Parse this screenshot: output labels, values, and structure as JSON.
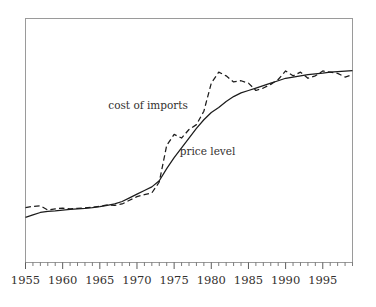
{
  "chart_data": {
    "type": "line",
    "title": "",
    "subtitle": "",
    "xlabel": "",
    "ylabel": "",
    "xlim": [
      1955,
      1999
    ],
    "ylim": [
      0,
      100
    ],
    "grid": false,
    "legend_position": "inline-annotations",
    "x_tick_labels": [
      "1955",
      "1960",
      "1965",
      "1970",
      "1975",
      "1980",
      "1985",
      "1990",
      "1995"
    ],
    "x_tick_values": [
      1955,
      1960,
      1965,
      1970,
      1975,
      1980,
      1985,
      1990,
      1995
    ],
    "x_minor_tick_interval": 1,
    "y_tick_labels": [],
    "annotations": [
      {
        "text": "cost of imports",
        "x": 1971.5,
        "y": 63
      },
      {
        "text": "price level",
        "x": 1979.5,
        "y": 44
      }
    ],
    "series": [
      {
        "name": "cost of imports",
        "style": "dashed",
        "color": "#1c1c1c",
        "x": [
          1955,
          1956,
          1957,
          1958,
          1959,
          1960,
          1961,
          1962,
          1963,
          1964,
          1965,
          1966,
          1967,
          1968,
          1969,
          1970,
          1971,
          1972,
          1973,
          1974,
          1975,
          1976,
          1977,
          1978,
          1979,
          1980,
          1981,
          1982,
          1983,
          1984,
          1985,
          1986,
          1987,
          1988,
          1989,
          1990,
          1991,
          1992,
          1993,
          1994,
          1995,
          1996,
          1997,
          1998,
          1999
        ],
        "values": [
          22.5,
          23.0,
          23.2,
          21.5,
          22.0,
          22.3,
          22.0,
          22.2,
          22.4,
          22.6,
          23.0,
          23.6,
          23.4,
          24.0,
          25.5,
          27.0,
          27.8,
          28.5,
          33.0,
          48.0,
          52.5,
          51.0,
          54.5,
          56.5,
          62.0,
          73.5,
          78.0,
          76.5,
          74.0,
          74.5,
          73.5,
          70.5,
          71.5,
          73.0,
          75.0,
          78.5,
          76.5,
          78.0,
          75.5,
          76.5,
          78.5,
          78.0,
          77.5,
          76.0,
          77.0
        ]
      },
      {
        "name": "price level",
        "style": "solid",
        "color": "#1c1c1c",
        "x": [
          1955,
          1956,
          1957,
          1958,
          1959,
          1960,
          1961,
          1962,
          1963,
          1964,
          1965,
          1966,
          1967,
          1968,
          1969,
          1970,
          1971,
          1972,
          1973,
          1974,
          1975,
          1976,
          1977,
          1978,
          1979,
          1980,
          1981,
          1982,
          1983,
          1984,
          1985,
          1986,
          1987,
          1988,
          1989,
          1990,
          1991,
          1992,
          1993,
          1994,
          1995,
          1996,
          1997,
          1998,
          1999
        ],
        "values": [
          18.5,
          19.5,
          20.5,
          21.0,
          21.2,
          21.5,
          21.8,
          22.0,
          22.2,
          22.5,
          22.9,
          23.4,
          24.0,
          25.0,
          26.5,
          28.0,
          29.5,
          31.0,
          33.5,
          38.5,
          43.0,
          47.0,
          51.0,
          55.0,
          58.5,
          61.5,
          63.5,
          66.0,
          68.0,
          69.5,
          70.5,
          71.5,
          72.5,
          73.5,
          74.5,
          75.5,
          76.0,
          76.5,
          77.0,
          77.3,
          77.6,
          78.0,
          78.2,
          78.4,
          78.6
        ]
      }
    ]
  }
}
